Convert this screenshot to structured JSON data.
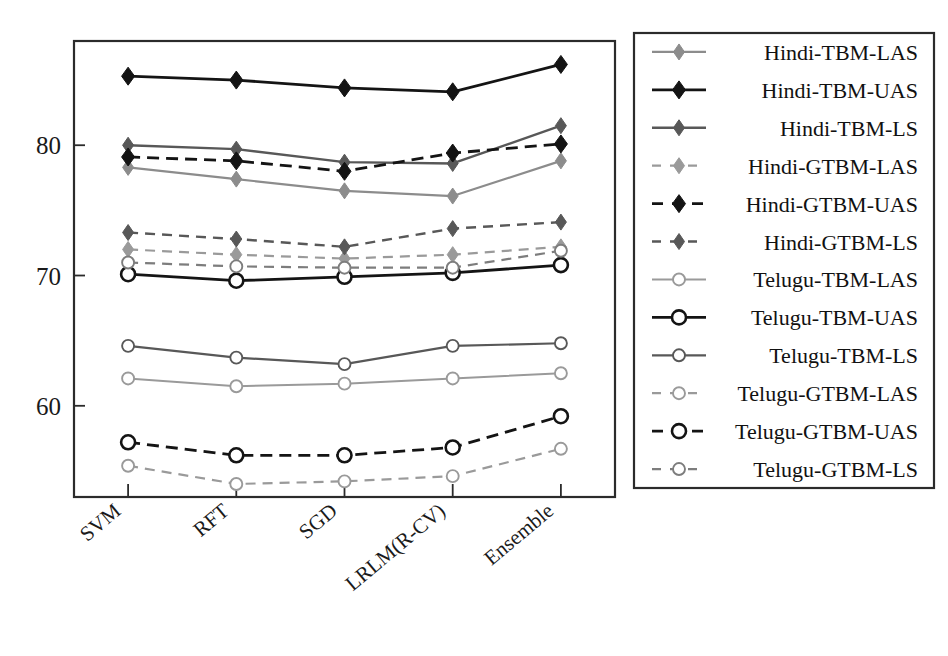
{
  "chart_data": {
    "type": "line",
    "title": "",
    "xlabel": "",
    "ylabel": "",
    "categories": [
      "SVM",
      "RFT",
      "SGD",
      "LRLM(R-CV)",
      "Ensemble"
    ],
    "ylim": [
      53,
      88
    ],
    "yticks": [
      60,
      70,
      80
    ],
    "ytick_labels": [
      "60",
      "70",
      "80"
    ],
    "grid": false,
    "legend_position": "right-outside",
    "series": [
      {
        "name": "Hindi-TBM-LAS",
        "values": [
          78.3,
          77.4,
          76.5,
          76.1,
          78.8
        ],
        "color": "#8c8c8c",
        "dash": "solid",
        "marker": "diamond",
        "width": 2.2
      },
      {
        "name": "Hindi-TBM-UAS",
        "values": [
          85.3,
          85.0,
          84.4,
          84.1,
          86.2
        ],
        "color": "#141414",
        "dash": "solid",
        "marker": "diamond",
        "width": 2.8
      },
      {
        "name": "Hindi-TBM-LS",
        "values": [
          80.0,
          79.7,
          78.7,
          78.6,
          81.5
        ],
        "color": "#585858",
        "dash": "solid",
        "marker": "diamond",
        "width": 2.4
      },
      {
        "name": "Hindi-GTBM-LAS",
        "values": [
          72.0,
          71.6,
          71.3,
          71.6,
          72.2
        ],
        "color": "#9a9a9a",
        "dash": "dashed",
        "marker": "diamond",
        "width": 2.2
      },
      {
        "name": "Hindi-GTBM-UAS",
        "values": [
          79.1,
          78.8,
          78.0,
          79.4,
          80.1
        ],
        "color": "#141414",
        "dash": "dashed",
        "marker": "diamond",
        "width": 2.8
      },
      {
        "name": "Hindi-GTBM-LS",
        "values": [
          73.3,
          72.8,
          72.2,
          73.6,
          74.1
        ],
        "color": "#585858",
        "dash": "dashed",
        "marker": "diamond",
        "width": 2.4
      },
      {
        "name": "Telugu-TBM-LAS",
        "values": [
          62.1,
          61.5,
          61.7,
          62.1,
          62.5
        ],
        "color": "#9a9a9a",
        "dash": "solid",
        "marker": "circle",
        "width": 2.0
      },
      {
        "name": "Telugu-TBM-UAS",
        "values": [
          70.1,
          69.6,
          69.9,
          70.2,
          70.8
        ],
        "color": "#141414",
        "dash": "solid",
        "marker": "circle",
        "width": 2.8
      },
      {
        "name": "Telugu-TBM-LS",
        "values": [
          64.6,
          63.7,
          63.2,
          64.6,
          64.8
        ],
        "color": "#585858",
        "dash": "solid",
        "marker": "circle",
        "width": 2.2
      },
      {
        "name": "Telugu-GTBM-LAS",
        "values": [
          55.4,
          54.0,
          54.2,
          54.6,
          56.7
        ],
        "color": "#9a9a9a",
        "dash": "dashed",
        "marker": "circle",
        "width": 2.2
      },
      {
        "name": "Telugu-GTBM-UAS",
        "values": [
          57.2,
          56.2,
          56.2,
          56.8,
          59.2
        ],
        "color": "#141414",
        "dash": "dashed",
        "marker": "circle",
        "width": 2.8
      },
      {
        "name": "Telugu-GTBM-LS",
        "values": [
          71.0,
          70.7,
          70.6,
          70.6,
          71.9
        ],
        "color": "#7d7d7d",
        "dash": "dashed",
        "marker": "circle",
        "width": 2.2
      }
    ]
  },
  "legend": {
    "items": [
      "Hindi-TBM-LAS",
      "Hindi-TBM-UAS",
      "Hindi-TBM-LS",
      "Hindi-GTBM-LAS",
      "Hindi-GTBM-UAS",
      "Hindi-GTBM-LS",
      "Telugu-TBM-LAS",
      "Telugu-TBM-UAS",
      "Telugu-TBM-LS",
      "Telugu-GTBM-LAS",
      "Telugu-GTBM-UAS",
      "Telugu-GTBM-LS"
    ]
  },
  "axes": {
    "frame_color": "#2b2b2b",
    "background": "#ffffff"
  }
}
